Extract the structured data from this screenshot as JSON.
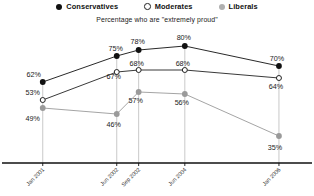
{
  "chart_data": {
    "type": "line",
    "title": "",
    "subtitle": "Percentage who are \"extremely proud\"",
    "xlabel": "",
    "ylabel": "",
    "ylim": [
      0,
      100
    ],
    "grid": "vertical-droplines",
    "legend_position": "top-center",
    "categories": [
      "Jan 2001",
      "Jun 2002",
      "Sep 2002",
      "Jun 2004",
      "Jan 2006"
    ],
    "x_positions": [
      57,
      182,
      219,
      297,
      456
    ],
    "series": [
      {
        "name": "Conservatives",
        "marker": "filled-circle",
        "color": "#111111",
        "values": [
          62,
          75,
          78,
          80,
          70
        ],
        "labels": [
          "62%",
          "75%",
          "78%",
          "80%",
          "70%"
        ]
      },
      {
        "name": "Moderates",
        "marker": "open-circle",
        "color": "#222222",
        "values": [
          53,
          67,
          68,
          68,
          64
        ],
        "labels": [
          "53%",
          "67%",
          "68%",
          "68%",
          "64%"
        ]
      },
      {
        "name": "Liberals",
        "marker": "filled-circle",
        "color": "#9a9a9a",
        "values": [
          49,
          46,
          57,
          56,
          35
        ],
        "labels": [
          "49%",
          "46%",
          "57%",
          "56%",
          "35%"
        ]
      }
    ]
  },
  "legend": {
    "items": [
      {
        "label": "Conservatives",
        "key": "solid-circle-icon"
      },
      {
        "label": "Moderates",
        "key": "open-circle-icon"
      },
      {
        "label": "Liberals",
        "key": "gray-circle-icon"
      }
    ]
  },
  "axis": {
    "ticks": [
      {
        "label": "Jan 2001"
      },
      {
        "label": "Jun 2002"
      },
      {
        "label": "Sep 2002"
      },
      {
        "label": "Jun 2004"
      },
      {
        "label": "Jan 2006"
      }
    ]
  },
  "colors": {
    "conservatives": "#111111",
    "moderates": "#ffffff",
    "liberals": "#9a9a9a",
    "axis": "#111111",
    "gridline": "#bbbbbb"
  }
}
